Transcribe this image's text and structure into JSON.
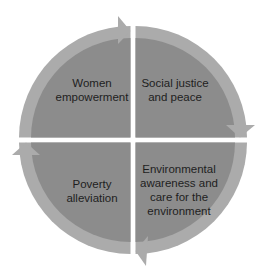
{
  "diagram": {
    "type": "cycle",
    "colors": {
      "background": "#ffffff",
      "quadrant_fill": "#8c8c8c",
      "arrow_ring": "#ababab",
      "text": "#1e1e1e"
    },
    "quadrants": [
      {
        "id": "top-left",
        "label": "Women\nempowerment"
      },
      {
        "id": "top-right",
        "label": "Social justice\nand peace"
      },
      {
        "id": "bottom-right",
        "label": "Environmental\nawareness and\ncare for the\nenvironment"
      },
      {
        "id": "bottom-left",
        "label": "Poverty\nalleviation"
      }
    ],
    "flow_direction": "clockwise"
  }
}
